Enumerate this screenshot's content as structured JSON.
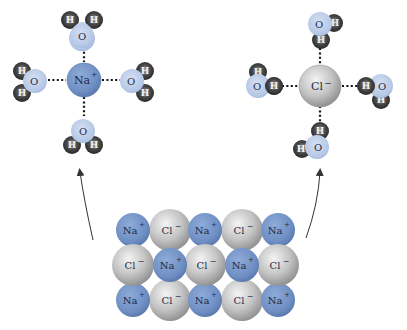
{
  "diagram": {
    "colors": {
      "sodium": "#6f8fc4",
      "chlorine": "#c9c9c9",
      "oxygen": "#b9cbe8",
      "hydrogen": "#3a3a3a",
      "bond_dots": "#111111",
      "arrow": "#333333"
    },
    "hydrated_sodium": {
      "ion_label": "Na",
      "ion_charge": "+",
      "water_molecules": [
        {
          "position": "top",
          "oxygen": "O",
          "hydrogens": [
            "H",
            "H"
          ]
        },
        {
          "position": "left",
          "oxygen": "O",
          "hydrogens": [
            "H",
            "H"
          ]
        },
        {
          "position": "right",
          "oxygen": "O",
          "hydrogens": [
            "H",
            "H"
          ]
        },
        {
          "position": "bottom",
          "oxygen": "O",
          "hydrogens": [
            "H",
            "H"
          ]
        }
      ]
    },
    "hydrated_chloride": {
      "ion_label": "Cl",
      "ion_charge": "−",
      "water_molecules": [
        {
          "position": "top",
          "oxygen": "O",
          "hydrogens": [
            "H",
            "H"
          ]
        },
        {
          "position": "left",
          "oxygen": "O",
          "hydrogens": [
            "H",
            "H"
          ]
        },
        {
          "position": "right",
          "oxygen": "O",
          "hydrogens": [
            "H",
            "H"
          ]
        },
        {
          "position": "bottom",
          "oxygen": "O",
          "hydrogens": [
            "H",
            "H"
          ]
        }
      ]
    },
    "crystal_lattice": {
      "rows": [
        [
          "Na+",
          "Cl−",
          "Na+",
          "Cl−",
          "Na+"
        ],
        [
          "Cl−",
          "Na+",
          "Cl−",
          "Na+",
          "Cl−"
        ],
        [
          "Na+",
          "Cl−",
          "Na+",
          "Cl−",
          "Na+"
        ]
      ],
      "na_label": "Na",
      "na_charge": "+",
      "cl_label": "Cl",
      "cl_charge": "−"
    },
    "arrows": [
      {
        "from": "crystal_lattice",
        "to": "hydrated_sodium"
      },
      {
        "from": "crystal_lattice",
        "to": "hydrated_chloride"
      }
    ]
  }
}
